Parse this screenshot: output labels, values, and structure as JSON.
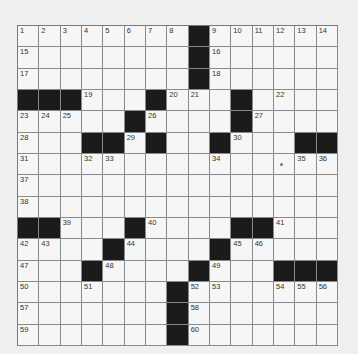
{
  "puzzle": {
    "rows": 15,
    "cols": 15,
    "grid": [
      "........#......",
      "........#......",
      "........#......",
      "###...#...#....",
      ".....#....#....",
      "...##.#..#...##",
      "...............",
      "...............",
      "...............",
      "##...#....##...",
      "....#....#.....",
      "...#....#...###",
      ".......#.......",
      ".......#.......",
      ".......#......."
    ],
    "numbers": [
      {
        "n": "1",
        "r": 0,
        "c": 0
      },
      {
        "n": "2",
        "r": 0,
        "c": 1
      },
      {
        "n": "3",
        "r": 0,
        "c": 2
      },
      {
        "n": "4",
        "r": 0,
        "c": 3
      },
      {
        "n": "5",
        "r": 0,
        "c": 4
      },
      {
        "n": "6",
        "r": 0,
        "c": 5
      },
      {
        "n": "7",
        "r": 0,
        "c": 6
      },
      {
        "n": "8",
        "r": 0,
        "c": 7
      },
      {
        "n": "9",
        "r": 0,
        "c": 9
      },
      {
        "n": "10",
        "r": 0,
        "c": 10
      },
      {
        "n": "11",
        "r": 0,
        "c": 11
      },
      {
        "n": "12",
        "r": 0,
        "c": 12
      },
      {
        "n": "13",
        "r": 0,
        "c": 13
      },
      {
        "n": "14",
        "r": 0,
        "c": 14
      },
      {
        "n": "15",
        "r": 1,
        "c": 0
      },
      {
        "n": "16",
        "r": 1,
        "c": 9
      },
      {
        "n": "17",
        "r": 2,
        "c": 0
      },
      {
        "n": "18",
        "r": 2,
        "c": 9
      },
      {
        "n": "19",
        "r": 3,
        "c": 3
      },
      {
        "n": "20",
        "r": 3,
        "c": 7
      },
      {
        "n": "21",
        "r": 3,
        "c": 8
      },
      {
        "n": "22",
        "r": 3,
        "c": 12
      },
      {
        "n": "23",
        "r": 4,
        "c": 0
      },
      {
        "n": "24",
        "r": 4,
        "c": 1
      },
      {
        "n": "25",
        "r": 4,
        "c": 2
      },
      {
        "n": "26",
        "r": 4,
        "c": 6
      },
      {
        "n": "27",
        "r": 4,
        "c": 11
      },
      {
        "n": "28",
        "r": 5,
        "c": 0
      },
      {
        "n": "29",
        "r": 5,
        "c": 5
      },
      {
        "n": "30",
        "r": 5,
        "c": 10
      },
      {
        "n": "31",
        "r": 6,
        "c": 0
      },
      {
        "n": "32",
        "r": 6,
        "c": 3
      },
      {
        "n": "33",
        "r": 6,
        "c": 4
      },
      {
        "n": "34",
        "r": 6,
        "c": 9
      },
      {
        "n": "35",
        "r": 6,
        "c": 13
      },
      {
        "n": "36",
        "r": 6,
        "c": 14
      },
      {
        "n": "37",
        "r": 7,
        "c": 0
      },
      {
        "n": "38",
        "r": 8,
        "c": 0
      },
      {
        "n": "39",
        "r": 9,
        "c": 2
      },
      {
        "n": "40",
        "r": 9,
        "c": 6
      },
      {
        "n": "41",
        "r": 9,
        "c": 12
      },
      {
        "n": "42",
        "r": 10,
        "c": 0
      },
      {
        "n": "43",
        "r": 10,
        "c": 1
      },
      {
        "n": "44",
        "r": 10,
        "c": 5
      },
      {
        "n": "45",
        "r": 10,
        "c": 10
      },
      {
        "n": "46",
        "r": 10,
        "c": 11
      },
      {
        "n": "47",
        "r": 11,
        "c": 0
      },
      {
        "n": "48",
        "r": 11,
        "c": 4
      },
      {
        "n": "49",
        "r": 11,
        "c": 9
      },
      {
        "n": "50",
        "r": 12,
        "c": 0
      },
      {
        "n": "51",
        "r": 12,
        "c": 3
      },
      {
        "n": "52",
        "r": 12,
        "c": 8
      },
      {
        "n": "53",
        "r": 12,
        "c": 9
      },
      {
        "n": "54",
        "r": 12,
        "c": 12
      },
      {
        "n": "55",
        "r": 12,
        "c": 13
      },
      {
        "n": "56",
        "r": 12,
        "c": 14
      },
      {
        "n": "57",
        "r": 13,
        "c": 0
      },
      {
        "n": "58",
        "r": 13,
        "c": 8
      },
      {
        "n": "59",
        "r": 14,
        "c": 0
      },
      {
        "n": "60",
        "r": 14,
        "c": 8
      }
    ],
    "marks": [
      {
        "r": 6,
        "c": 12
      }
    ]
  },
  "colors": {
    "background": "#efefef",
    "cell": "#f6f6f6",
    "block": "#1b1b1b",
    "grid_line": "#8a8a8a"
  }
}
